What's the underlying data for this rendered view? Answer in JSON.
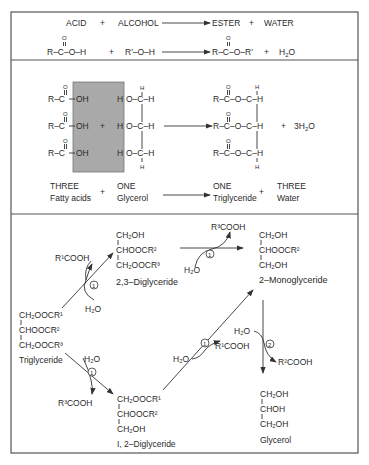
{
  "colors": {
    "line": "#333333",
    "text": "#2a2a2a",
    "highlight_box": "#a9a9a9",
    "border": "#555555",
    "background": "#ffffff"
  },
  "panel1": {
    "word_eq": {
      "acid": "ACID",
      "plus1": "+",
      "alcohol": "ALCOHOL",
      "ester": "ESTER",
      "plus2": "+",
      "water": "WATER"
    },
    "formula_eq": {
      "acid_o": "O",
      "acid": "R–C–O–H",
      "plus1": "+",
      "alcohol": "R′–O–H",
      "ester_o": "O",
      "ester": "R–C–O–R′",
      "plus2": "+",
      "water": "H",
      "water_sub": "2",
      "water_o": "O"
    }
  },
  "panel2": {
    "acid_rows": [
      {
        "o": "O",
        "rc": "R–C",
        "oh": "OH"
      },
      {
        "o": "O",
        "rc": "R–C",
        "oh": "OH"
      },
      {
        "o": "O",
        "rc": "R–C",
        "oh": "OH"
      }
    ],
    "plus": "+",
    "glycerol_top_h": "H",
    "glycerol_rows": [
      {
        "h": "H",
        "oc": "O–C–H"
      },
      {
        "h": "H",
        "oc": "O–C–H"
      },
      {
        "h": "H",
        "oc": "O–C–H"
      }
    ],
    "glycerol_bottom_h": "H",
    "product_top_h": "H",
    "product_rows": [
      {
        "o": "O",
        "text": "R–C–O–C–H"
      },
      {
        "o": "O",
        "text": "R–C–O–C–H"
      },
      {
        "o": "O",
        "text": "R–C–O–C–H"
      }
    ],
    "product_bottom_h": "H",
    "water_plus": "+",
    "water": "3H",
    "water_sub": "2",
    "water_o": "O",
    "labels": {
      "fatty_count": "THREE",
      "fatty_name": "Fatty acids",
      "plus1": "+",
      "glycerol_count": "ONE",
      "glycerol_name": "Glycerol",
      "tri_count": "ONE",
      "tri_name": "Triglyceride",
      "plus2": "+",
      "water_count": "THREE",
      "water_name": "Water"
    }
  },
  "panel3": {
    "triglyceride": {
      "l1": "CH₂OOCR¹",
      "l2": "CHOOCR²",
      "l3": "CH₂OOCR³",
      "name": "Triglyceride"
    },
    "diglyceride_23": {
      "l1": "CH₂OH",
      "l2": "CHOOCR²",
      "l3": "CH₂OOCR³",
      "name": "2,3–Diglyceride"
    },
    "diglyceride_12": {
      "l1": "CH₂OOCR¹",
      "l2": "CHOOCR²",
      "l3": "CH₂OH",
      "name": "I, 2–Diglyceride"
    },
    "monoglyceride": {
      "l1": "CH₂OH",
      "l2": "CHOOCR²",
      "l3": "CH₂OH",
      "name": "2–Monoglyceride"
    },
    "glycerol": {
      "l1": "CH₂OH",
      "l2": "CHOH",
      "l3": "CH₂OH",
      "name": "Glycerol"
    },
    "reactions": [
      {
        "step": "1",
        "water": "H₂O",
        "released": "R¹COOH"
      },
      {
        "step": "1",
        "water": "H₂O",
        "released": "R³COOH"
      },
      {
        "step": "1",
        "water": "H₂O",
        "released": "R³COOH"
      },
      {
        "step": "1",
        "water": "H₂O",
        "released": "R¹COOH"
      },
      {
        "step": "2",
        "water": "H₂O",
        "released": "R²COOH"
      }
    ]
  }
}
